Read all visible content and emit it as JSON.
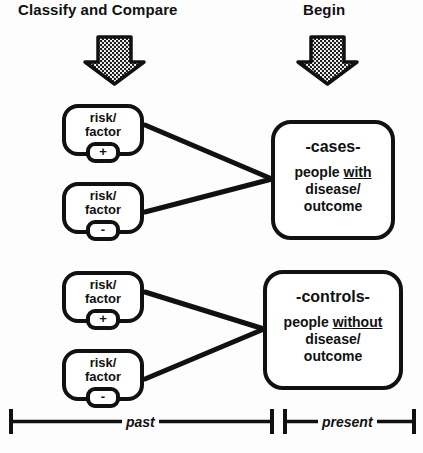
{
  "headers": {
    "classify": "Classify and Compare",
    "begin": "Begin"
  },
  "icons": {
    "arrow_down_left": "down-block-arrow",
    "arrow_down_right": "down-block-arrow"
  },
  "risk_factor_boxes": [
    {
      "line1": "risk/",
      "line2": "factor",
      "sign": "+"
    },
    {
      "line1": "risk/",
      "line2": "factor",
      "sign": "-"
    },
    {
      "line1": "risk/",
      "line2": "factor",
      "sign": "+"
    },
    {
      "line1": "risk/",
      "line2": "factor",
      "sign": "-"
    }
  ],
  "groups": {
    "cases": {
      "title": "-cases-",
      "desc_prefix": "people ",
      "desc_emphasis": "with",
      "desc_line2": "disease/",
      "desc_line3": "outcome"
    },
    "controls": {
      "title": "-controls-",
      "desc_prefix": "people ",
      "desc_emphasis": "without",
      "desc_line2": "disease/",
      "desc_line3": "outcome"
    }
  },
  "timeline": {
    "past_label": "past",
    "present_label": "present"
  },
  "colors": {
    "ink": "#111111",
    "background": "#fdfdfd",
    "arrow_fill": "#8a8a8a"
  }
}
